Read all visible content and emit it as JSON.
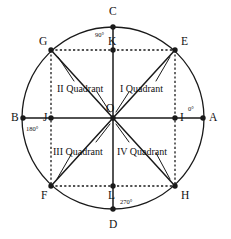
{
  "figure": {
    "colors": {
      "stroke": "#1a1a1a",
      "dashed": "#1a1a1a",
      "background": "#ffffff",
      "text": "#111111"
    },
    "geometry": {
      "center": {
        "x": 113,
        "y": 118
      },
      "radius": 91,
      "square_half": 62
    }
  },
  "points": [
    {
      "id": "A",
      "label": "A",
      "x": 203,
      "y": 118,
      "label_x": 209,
      "label_y": 112,
      "dot": true
    },
    {
      "id": "B",
      "label": "B",
      "x": 23,
      "y": 118,
      "label_x": 11,
      "label_y": 112,
      "dot": true
    },
    {
      "id": "C",
      "label": "C",
      "x": 113,
      "y": 27,
      "label_x": 109,
      "label_y": 6,
      "dot": true
    },
    {
      "id": "D",
      "label": "D",
      "x": 113,
      "y": 209,
      "label_x": 109,
      "label_y": 219,
      "dot": true
    },
    {
      "id": "E",
      "label": "E",
      "x": 175,
      "y": 50,
      "label_x": 181,
      "label_y": 36,
      "dot": true
    },
    {
      "id": "F",
      "label": "F",
      "x": 51,
      "y": 186,
      "label_x": 41,
      "label_y": 190,
      "dot": true
    },
    {
      "id": "G",
      "label": "G",
      "x": 51,
      "y": 50,
      "label_x": 39,
      "label_y": 36,
      "dot": true
    },
    {
      "id": "H",
      "label": "H",
      "x": 175,
      "y": 186,
      "label_x": 181,
      "label_y": 190,
      "dot": true
    },
    {
      "id": "I",
      "label": "I",
      "x": 175,
      "y": 118,
      "label_x": 180,
      "label_y": 112,
      "dot": true
    },
    {
      "id": "J",
      "label": "J",
      "x": 51,
      "y": 118,
      "label_x": 43,
      "label_y": 112,
      "dot": true
    },
    {
      "id": "K",
      "label": "K",
      "x": 113,
      "y": 50,
      "label_x": 108,
      "label_y": 36,
      "dot": true
    },
    {
      "id": "L",
      "label": "L",
      "x": 113,
      "y": 186,
      "label_x": 108,
      "label_y": 190,
      "dot": true
    },
    {
      "id": "O",
      "label": "O",
      "x": 113,
      "y": 118,
      "label_x": 106,
      "label_y": 103,
      "dot": true
    }
  ],
  "angle_labels": [
    {
      "id": "zero",
      "text": "0°",
      "x": 188,
      "y": 106
    },
    {
      "id": "ninety",
      "text": "90°",
      "x": 95,
      "y": 32
    },
    {
      "id": "one-eighty",
      "text": "180°",
      "x": 26,
      "y": 126
    },
    {
      "id": "two-seventy",
      "text": "270°",
      "x": 120,
      "y": 199
    }
  ],
  "quadrant_labels": [
    {
      "id": "quadrant-1",
      "text": "I Quadrant",
      "x": 120,
      "y": 84
    },
    {
      "id": "quadrant-2",
      "text": "II Quadrant",
      "x": 57,
      "y": 84
    },
    {
      "id": "quadrant-3",
      "text": "III Quadrant",
      "x": 53,
      "y": 147
    },
    {
      "id": "quadrant-4",
      "text": "IV Quadrant",
      "x": 117,
      "y": 147
    }
  ],
  "leader_lines": [
    {
      "id": "leader-q1-to-E",
      "x1": 156,
      "y1": 81,
      "x2": 170,
      "y2": 57
    },
    {
      "id": "leader-q1-to-O",
      "x1": 129,
      "y1": 92,
      "x2": 116,
      "y2": 112
    },
    {
      "id": "leader-q2-to-G",
      "x1": 74,
      "y1": 81,
      "x2": 58,
      "y2": 57
    },
    {
      "id": "leader-q2-to-O",
      "x1": 97,
      "y1": 92,
      "x2": 110,
      "y2": 112
    },
    {
      "id": "leader-q3-to-F",
      "x1": 72,
      "y1": 153,
      "x2": 57,
      "y2": 179
    },
    {
      "id": "leader-q3-to-O",
      "x1": 96,
      "y1": 142,
      "x2": 110,
      "y2": 124
    },
    {
      "id": "leader-q4-to-H",
      "x1": 156,
      "y1": 153,
      "x2": 170,
      "y2": 179
    },
    {
      "id": "leader-q4-to-O",
      "x1": 129,
      "y1": 142,
      "x2": 116,
      "y2": 124
    }
  ],
  "solid_segments": [
    {
      "id": "axis-horizontal-BA",
      "x1": 23,
      "y1": 118,
      "x2": 203,
      "y2": 118
    },
    {
      "id": "axis-vertical-CD",
      "x1": 113,
      "y1": 27,
      "x2": 113,
      "y2": 209
    },
    {
      "id": "diagonal-GH",
      "x1": 51,
      "y1": 50,
      "x2": 175,
      "y2": 186
    },
    {
      "id": "diagonal-EF",
      "x1": 175,
      "y1": 50,
      "x2": 51,
      "y2": 186
    }
  ],
  "dashed_segments": [
    {
      "id": "square-top-GE",
      "x1": 51,
      "y1": 50,
      "x2": 175,
      "y2": 50
    },
    {
      "id": "square-bottom-FH",
      "x1": 51,
      "y1": 186,
      "x2": 175,
      "y2": 186
    },
    {
      "id": "square-left-GF",
      "x1": 51,
      "y1": 50,
      "x2": 51,
      "y2": 186
    },
    {
      "id": "square-right-EH",
      "x1": 175,
      "y1": 50,
      "x2": 175,
      "y2": 186
    }
  ]
}
